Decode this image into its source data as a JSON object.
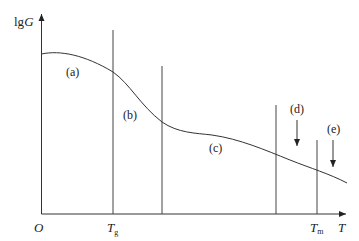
{
  "diagram": {
    "y_axis_label": {
      "prefix": "lg",
      "var": "G"
    },
    "x_axis_label": "T",
    "origin_label": "O",
    "markers": [
      {
        "id": "tg",
        "base": "T",
        "sub": "g"
      },
      {
        "id": "tm",
        "base": "T",
        "sub": "m"
      }
    ],
    "regions": [
      "(a)",
      "(b)",
      "(c)",
      "(d)",
      "(e)"
    ],
    "colors": {
      "line": "#333333",
      "text": "#222222",
      "background": "#ffffff"
    }
  }
}
